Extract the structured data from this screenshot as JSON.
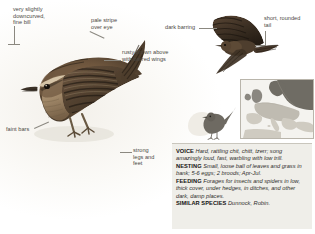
{
  "page": {
    "species": "Wren",
    "plate_type": "field-guide-illustration-plate"
  },
  "annotations": [
    {
      "id": "bill",
      "text": "very slightly\ndowncurved,\nfine bill"
    },
    {
      "id": "eyestripe",
      "text": "pale stripe\nover eye"
    },
    {
      "id": "barring",
      "text": "dark barring"
    },
    {
      "id": "tail",
      "text": "short, rounded\ntail"
    },
    {
      "id": "upperparts",
      "text": "rusty-brown above\nwith barred wings"
    },
    {
      "id": "faintbars",
      "text": "faint bars"
    },
    {
      "id": "legs",
      "text": "strong\nlegs and\nfeet"
    }
  ],
  "info": {
    "voice": {
      "heading": "VOICE",
      "body": "Hard, rattling chit, chitt, tzerr; song amazingly loud, fast, warbling with low trill."
    },
    "nesting": {
      "heading": "NESTING",
      "body": "Small, loose ball of leaves and grass in bank; 5-6 eggs; 2 broods; Apr-Jul."
    },
    "feeding": {
      "heading": "FEEDING",
      "body": "Forages for insects and spiders in low, thick cover, under hedges, in ditches, and other dark, damp places."
    },
    "similar": {
      "heading": "SIMILAR SPECIES",
      "body": "Dunnock, Robin."
    }
  },
  "map": {
    "name": "europe-range-map",
    "resident_color": "#6f6c64",
    "land_color": "#cfcbc1",
    "sea_color": "#f4f3ef"
  },
  "colors": {
    "plumage_dark": "#3b3228",
    "plumage_rust": "#7d6148",
    "plumage_pale": "#cbb79a",
    "label_text": "#4a4843",
    "panel_bg": "#efeee9"
  }
}
